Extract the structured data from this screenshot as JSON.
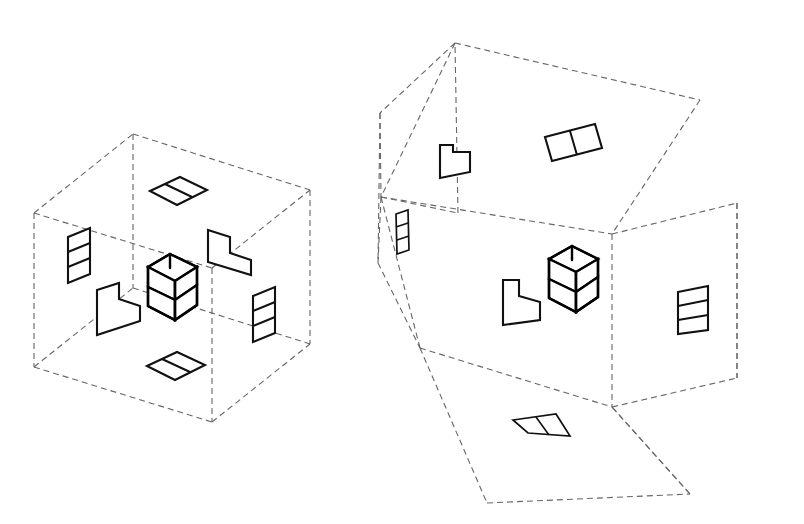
{
  "figure": {
    "type": "technical-line-diagram",
    "background_color": "#ffffff",
    "line_color_box": "#666666",
    "line_color_shape": "#111111",
    "line_style_box": "dashed",
    "line_style_shape": "solid"
  },
  "panels": [
    {
      "id": "closed-box",
      "name": "Closed projection box",
      "label": "",
      "description": "Isometric glass box with the L-tromino object suspended at the centre and its six orthographic views drawn on the interior faces.",
      "object": {
        "name": "L-tromino",
        "cube_count": 3,
        "description": "Three unit cubes forming an L / corner shape"
      },
      "projections": [
        {
          "face": "top",
          "name": "top-view",
          "shape": "domino-1x2",
          "cells": 2,
          "orientation": "horizontal"
        },
        {
          "face": "bottom",
          "name": "bottom-view",
          "shape": "domino-1x2",
          "cells": 2,
          "orientation": "horizontal"
        },
        {
          "face": "left",
          "name": "left-side-view",
          "shape": "domino-1x2",
          "cells": 2,
          "orientation": "vertical"
        },
        {
          "face": "right",
          "name": "right-side-view",
          "shape": "domino-1x2",
          "cells": 2,
          "orientation": "vertical"
        },
        {
          "face": "back",
          "name": "back-view",
          "shape": "L-tromino",
          "cells": 3,
          "orientation": "L-notch-top"
        },
        {
          "face": "front",
          "name": "front-view",
          "shape": "L-tromino",
          "cells": 3,
          "orientation": "L-notch-top"
        }
      ]
    },
    {
      "id": "unfolded-box",
      "name": "Unfolded projection box",
      "label": "",
      "description": "The same box with top, bottom, back and left faces hinged open, flattening the six orthographic views outward.",
      "object": {
        "name": "L-tromino",
        "cube_count": 3,
        "description": "Three unit cubes forming an L / corner shape"
      },
      "projections": [
        {
          "face": "top",
          "name": "top-view",
          "shape": "domino-1x2",
          "cells": 2,
          "orientation": "unfolded-up"
        },
        {
          "face": "bottom",
          "name": "bottom-view",
          "shape": "domino-1x2",
          "cells": 2,
          "orientation": "unfolded-down-foreshortened"
        },
        {
          "face": "left",
          "name": "left-side-view",
          "shape": "domino-1x2",
          "cells": 2,
          "orientation": "unfolded-left-foreshortened"
        },
        {
          "face": "right",
          "name": "right-side-view",
          "shape": "domino-1x2",
          "cells": 2,
          "orientation": "vertical"
        },
        {
          "face": "back",
          "name": "back-view",
          "shape": "L-tromino",
          "cells": 3,
          "orientation": "unfolded-back"
        },
        {
          "face": "front",
          "name": "front-view",
          "shape": "L-tromino",
          "cells": 3,
          "orientation": "L-notch-top"
        }
      ]
    }
  ]
}
